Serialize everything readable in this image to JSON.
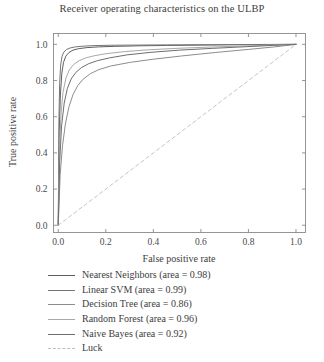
{
  "chart_data": {
    "type": "line",
    "title": "Receiver operating characteristics on the ULBP",
    "xlabel": "False positive rate",
    "ylabel": "True positive rate",
    "xlim": [
      -0.02,
      1.04
    ],
    "ylim": [
      -0.04,
      1.06
    ],
    "xticks": [
      "0.0",
      "0.2",
      "0.4",
      "0.6",
      "0.8",
      "1.0"
    ],
    "yticks": [
      "0.0",
      "0.2",
      "0.4",
      "0.6",
      "0.8",
      "1.0"
    ],
    "xtick_values": [
      0.0,
      0.2,
      0.4,
      0.6,
      0.8,
      1.0
    ],
    "ytick_values": [
      0.0,
      0.2,
      0.4,
      0.6,
      0.8,
      1.0
    ],
    "grid": false,
    "legend_position": "below-axes-left",
    "series": [
      {
        "name": "Nearest Neighbors (area = 0.98)",
        "label": "Nearest Neighbors (area = 0.98)",
        "area": 0.98,
        "color": "#5e5e5e",
        "style": "solid",
        "x": [
          0.0,
          0.004,
          0.009,
          0.015,
          0.022,
          0.032,
          0.045,
          0.062,
          0.085,
          0.12,
          0.17,
          0.24,
          0.34,
          0.46,
          0.6,
          0.75,
          0.88,
          1.0
        ],
        "y": [
          0.0,
          0.52,
          0.72,
          0.84,
          0.9,
          0.935,
          0.955,
          0.968,
          0.976,
          0.982,
          0.986,
          0.989,
          0.992,
          0.994,
          0.996,
          0.998,
          0.999,
          1.0
        ]
      },
      {
        "name": "Linear SVM (area = 0.99)",
        "label": "Linear SVM (area = 0.99)",
        "area": 0.99,
        "color": "#767676",
        "style": "solid",
        "x": [
          0.0,
          0.003,
          0.006,
          0.01,
          0.016,
          0.024,
          0.035,
          0.05,
          0.072,
          0.105,
          0.15,
          0.22,
          0.32,
          0.45,
          0.6,
          0.76,
          0.89,
          1.0
        ],
        "y": [
          0.0,
          0.6,
          0.79,
          0.885,
          0.935,
          0.958,
          0.972,
          0.98,
          0.986,
          0.99,
          0.993,
          0.995,
          0.996,
          0.997,
          0.998,
          0.999,
          0.9995,
          1.0
        ]
      },
      {
        "name": "Decision Tree (area = 0.86)",
        "label": "Decision Tree (area = 0.86)",
        "area": 0.86,
        "color": "#8c8c8c",
        "style": "solid",
        "x": [
          0.0,
          0.008,
          0.018,
          0.03,
          0.045,
          0.062,
          0.082,
          0.105,
          0.135,
          0.17,
          0.22,
          0.3,
          0.4,
          0.52,
          0.66,
          0.8,
          0.91,
          1.0
        ],
        "y": [
          0.0,
          0.28,
          0.44,
          0.56,
          0.655,
          0.722,
          0.772,
          0.808,
          0.838,
          0.86,
          0.88,
          0.9,
          0.918,
          0.936,
          0.955,
          0.972,
          0.986,
          1.0
        ]
      },
      {
        "name": "Random Forest (area = 0.96)",
        "label": "Random Forest (area = 0.96)",
        "area": 0.96,
        "color": "#a8a8a8",
        "style": "solid",
        "x": [
          0.0,
          0.005,
          0.012,
          0.02,
          0.032,
          0.046,
          0.064,
          0.088,
          0.118,
          0.155,
          0.205,
          0.28,
          0.38,
          0.5,
          0.64,
          0.78,
          0.9,
          1.0
        ],
        "y": [
          0.0,
          0.42,
          0.62,
          0.735,
          0.812,
          0.858,
          0.888,
          0.91,
          0.926,
          0.938,
          0.949,
          0.96,
          0.97,
          0.978,
          0.985,
          0.991,
          0.996,
          1.0
        ]
      },
      {
        "name": "Naive Bayes (area = 0.92)",
        "label": "Naive Bayes (area = 0.92)",
        "area": 0.92,
        "color": "#6e6e6e",
        "style": "solid",
        "x": [
          0.0,
          0.006,
          0.014,
          0.025,
          0.038,
          0.054,
          0.074,
          0.098,
          0.128,
          0.165,
          0.215,
          0.29,
          0.39,
          0.51,
          0.65,
          0.79,
          0.9,
          1.0
        ],
        "y": [
          0.0,
          0.35,
          0.55,
          0.675,
          0.755,
          0.808,
          0.845,
          0.872,
          0.893,
          0.91,
          0.925,
          0.942,
          0.956,
          0.968,
          0.978,
          0.987,
          0.994,
          1.0
        ]
      },
      {
        "name": "Luck",
        "label": "Luck",
        "color": "#c9b8bc",
        "style": "dashed",
        "x": [
          0.0,
          1.0
        ],
        "y": [
          0.0,
          1.0
        ]
      }
    ]
  }
}
